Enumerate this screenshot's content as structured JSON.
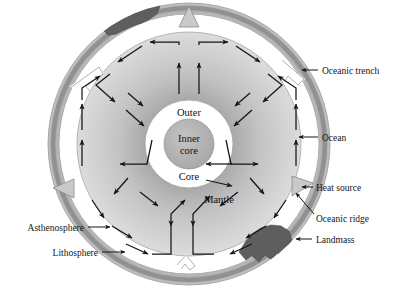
{
  "figure": {
    "type": "diagram",
    "width": 402,
    "height": 289,
    "background": "#ffffff"
  },
  "colors": {
    "lithosphere": "#b9b9b9",
    "lithosphere_dark": "#9a9a9a",
    "asthenosphere": "#ffffff",
    "mantle_outer": "#cfcfcf",
    "mantle_inner": "#b0b0b0",
    "outer_core": "#ffffff",
    "inner_core": "#b5b5b5",
    "landmass": "#5e5e5e",
    "marker": "#c9c9c9",
    "stroke": "#5a5a5a",
    "arrow": "#151515",
    "text": "#151515"
  },
  "inner_labels": [
    {
      "id": "outer",
      "text": "Outer",
      "x": 189,
      "y": 116
    },
    {
      "id": "inner-core-1",
      "text": "Inner",
      "x": 189,
      "y": 142
    },
    {
      "id": "inner-core-2",
      "text": "core",
      "x": 189,
      "y": 154
    },
    {
      "id": "core",
      "text": "Core",
      "x": 189,
      "y": 180
    },
    {
      "id": "mantle",
      "text": "Mantle",
      "x": 219,
      "y": 203
    }
  ],
  "callouts": [
    {
      "id": "oceanic-trench",
      "text": "Oceanic trench",
      "text_x": 322,
      "text_y": 74,
      "anchor": "start",
      "line": "M 318 70 L 300 70",
      "arrow": {
        "x": 296,
        "y": 70,
        "dir": "left"
      }
    },
    {
      "id": "ocean",
      "text": "Ocean",
      "text_x": 322,
      "text_y": 141,
      "anchor": "start",
      "line": "M 318 137 L 297 137",
      "arrow": {
        "x": 293,
        "y": 137,
        "dir": "left"
      }
    },
    {
      "id": "heat-source",
      "text": "Heat source",
      "text_x": 316,
      "text_y": 191,
      "anchor": "start",
      "line": "M 312 187 L 300 187",
      "arrow": {
        "x": 297,
        "y": 187,
        "dir": "left"
      }
    },
    {
      "id": "oceanic-ridge",
      "text": "Oceanic ridge",
      "text_x": 316,
      "text_y": 222,
      "anchor": "start",
      "line": "M 314 216 L 297 195",
      "arrow": {
        "x": 294,
        "y": 191,
        "dir": "upleft"
      }
    },
    {
      "id": "landmass",
      "text": "Landmass",
      "text_x": 316,
      "text_y": 243,
      "anchor": "start",
      "line": "M 312 239 L 296 239",
      "arrow": {
        "x": 292,
        "y": 239,
        "dir": "left"
      }
    },
    {
      "id": "asthenosphere",
      "text": "Asthenosphere",
      "text_x": 84,
      "text_y": 231,
      "anchor": "end",
      "line": "M 88 227 L 110 227",
      "arrow": {
        "x": 114,
        "y": 227,
        "dir": "right"
      }
    },
    {
      "id": "lithosphere",
      "text": "Lithosphere",
      "text_x": 98,
      "text_y": 256,
      "anchor": "end",
      "line": "M 102 252 L 124 252",
      "arrow": {
        "x": 128,
        "y": 252,
        "dir": "right"
      }
    }
  ],
  "features": {
    "ridges": [
      {
        "id": "ridge-top",
        "angle_deg": -90,
        "label": "oceanic ridge marker top"
      },
      {
        "id": "ridge-left",
        "angle_deg": 180,
        "label": "oceanic ridge marker left"
      },
      {
        "id": "ridge-right",
        "angle_deg": 19,
        "label": "oceanic ridge marker right"
      }
    ],
    "trenches": [
      {
        "id": "trench-upper-left",
        "angle_deg": 208,
        "label": "oceanic trench upper left"
      },
      {
        "id": "trench-upper-right",
        "angle_deg": -27,
        "label": "oceanic trench upper right"
      },
      {
        "id": "trench-bottom",
        "angle_deg": 94,
        "label": "oceanic trench bottom"
      }
    ],
    "landmasses": [
      {
        "id": "landmass-top-left",
        "label": "continent top left"
      },
      {
        "id": "landmass-bottom-right",
        "label": "continent bottom right"
      }
    ]
  },
  "geometry": {
    "center_x": 189,
    "center_y": 144,
    "r_litho_out": 141,
    "r_litho_in": 130,
    "r_asth_in": 112,
    "r_mantle_out": 112,
    "r_mantle_in": 44,
    "r_outer_core": 44,
    "r_inner_core": 25
  }
}
